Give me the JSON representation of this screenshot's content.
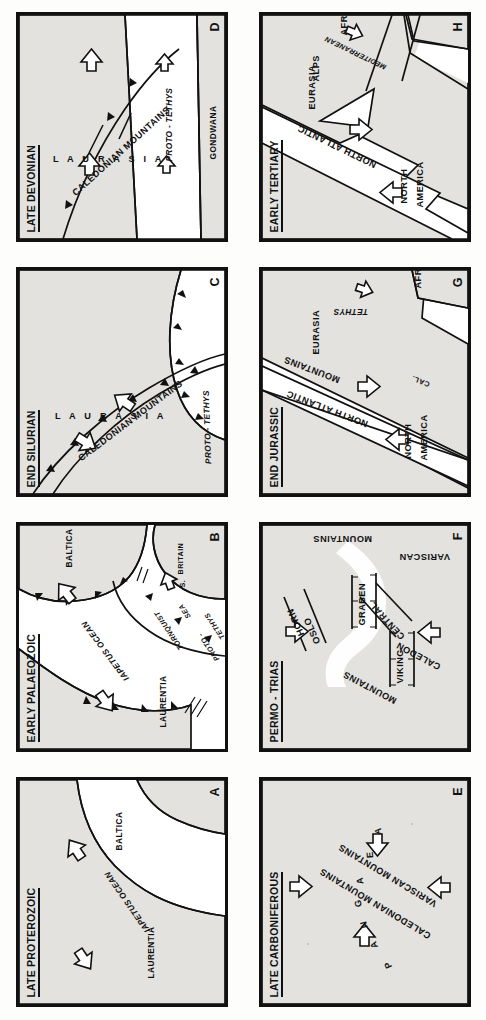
{
  "figure": {
    "orientation": "rotated-90-ccw",
    "panel_count": 8,
    "land_color": "#e3e2df",
    "ocean_color": "#ffffff",
    "line_color": "#111111"
  },
  "panels": [
    {
      "id": "A",
      "title": "LATE PROTEROZOIC",
      "labels": [
        {
          "text": "LAURENTIA"
        },
        {
          "text": "IAPETUS OCEAN"
        },
        {
          "text": "BALTICA"
        }
      ],
      "arrows": 2
    },
    {
      "id": "B",
      "title": "EARLY PALAEOZOIC",
      "labels": [
        {
          "text": "LAURENTIA"
        },
        {
          "text": "IAPETUS OCEAN"
        },
        {
          "text": "BALTICA"
        },
        {
          "text": "TORNQUIST"
        },
        {
          "text": "SEA"
        },
        {
          "text": "S."
        },
        {
          "text": "BRITAIN"
        },
        {
          "text": "PROTO -"
        },
        {
          "text": "TETHYS"
        }
      ],
      "arrows": 3
    },
    {
      "id": "C",
      "title": "END SILURIAN",
      "labels": [
        {
          "text": "L A U R A S I A"
        },
        {
          "text": "CALEDONIAN MOUNTAINS"
        },
        {
          "text": "PROTO - TETHYS"
        }
      ],
      "arrows": 2
    },
    {
      "id": "D",
      "title": "LATE DEVONIAN",
      "labels": [
        {
          "text": "L A U R A S I A"
        },
        {
          "text": "CALEDONIAN MOUNTAINS"
        },
        {
          "text": "PROTO - TETHYS"
        },
        {
          "text": "GONDWANA"
        }
      ],
      "arrows": 4
    },
    {
      "id": "E",
      "title": "LATE CARBONIFEROUS",
      "labels": [
        {
          "text": "P"
        },
        {
          "text": "A"
        },
        {
          "text": "N"
        },
        {
          "text": "G"
        },
        {
          "text": "A"
        },
        {
          "text": "E"
        },
        {
          "text": "A"
        },
        {
          "text": "CALEDONIAN MOUNTAINS"
        },
        {
          "text": "VARISCAN MOUNTAINS"
        }
      ],
      "arrows": 4
    },
    {
      "id": "F",
      "title": "PERMO - TRIAS",
      "labels": [
        {
          "text": "CALEDON"
        },
        {
          "text": "MOUNTAINS"
        },
        {
          "text": "VIKING"
        },
        {
          "text": "CENTRAL"
        },
        {
          "text": "GRABEN"
        },
        {
          "text": "OSLO"
        },
        {
          "text": "HORN"
        },
        {
          "text": "VARISCAN"
        },
        {
          "text": "MOUNTAINS"
        }
      ],
      "arrows": 3
    },
    {
      "id": "G",
      "title": "END JURASSIC",
      "labels": [
        {
          "text": "NORTH"
        },
        {
          "text": "AMERICA"
        },
        {
          "text": "NORTH ATLANTIC"
        },
        {
          "text": "CAL."
        },
        {
          "text": "MOUNTAINS"
        },
        {
          "text": "EURASIA"
        },
        {
          "text": "TETHYS"
        },
        {
          "text": "AFRICA"
        }
      ],
      "arrows": 3
    },
    {
      "id": "H",
      "title": "EARLY TERTIARY",
      "labels": [
        {
          "text": "NORTH"
        },
        {
          "text": "AMERICA"
        },
        {
          "text": "NORTH ATLANTIC"
        },
        {
          "text": "EURASIA"
        },
        {
          "text": "ALPS"
        },
        {
          "text": "MEDITERRANEAN"
        },
        {
          "text": "AFRICA"
        }
      ],
      "arrows": 3
    }
  ]
}
